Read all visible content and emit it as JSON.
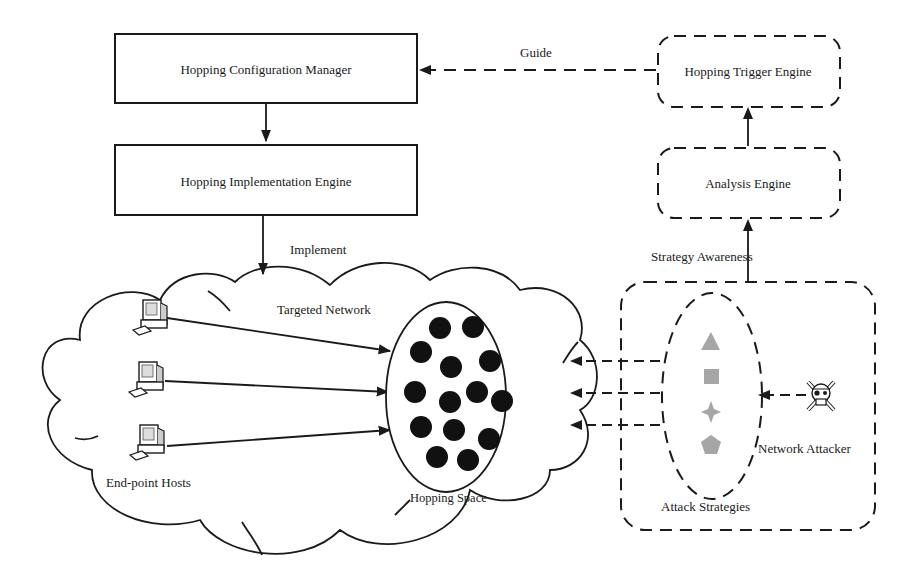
{
  "diagram": {
    "boxes": {
      "config_manager": "Hopping Configuration Manager",
      "implementation_engine": "Hopping Implementation Engine",
      "trigger_engine": "Hopping Trigger Engine",
      "analysis_engine": "Analysis Engine"
    },
    "edge_labels": {
      "guide": "Guide",
      "implement": "Implement",
      "strategy_awareness": "Strategy Awareness"
    },
    "regions": {
      "targeted_network": "Targeted Network",
      "end_point_hosts": "End-point Hosts",
      "hopping_space": "Hopping Space",
      "attack_strategies": "Attack Strategies",
      "network_attacker": "Network Attacker"
    },
    "hosts": [
      {
        "icon": "desktop-computer-icon"
      },
      {
        "icon": "desktop-computer-icon"
      },
      {
        "icon": "desktop-computer-icon"
      }
    ],
    "hopping_space_tokens": 15,
    "strategy_shapes": [
      "triangle",
      "square",
      "four-point-star",
      "pentagon"
    ],
    "attacker_icon": "skull-crossbones-icon",
    "colors": {
      "line": "#1a1a1a",
      "token": "#111111",
      "strategy_shape": "#a6a6a6",
      "background": "#ffffff"
    }
  }
}
